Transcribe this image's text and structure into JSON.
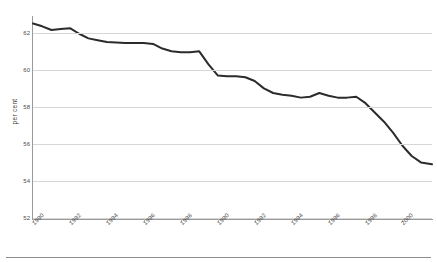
{
  "chart_data": {
    "type": "line",
    "title": "",
    "xlabel": "",
    "ylabel": "per cent",
    "ylim": [
      52,
      62.8
    ],
    "yticks": [
      52,
      54,
      56,
      58,
      60,
      62
    ],
    "xticklabels": [
      "1990",
      "1992",
      "1994",
      "1996",
      "1998",
      "1990",
      "1992",
      "1994",
      "1996",
      "1998",
      "2000",
      "2002",
      "2004",
      "2006",
      "2008",
      "2010"
    ],
    "xtick_years": [
      1990,
      1992,
      1994,
      1996,
      1998,
      2000,
      2002,
      2004,
      2006,
      2008,
      2010
    ],
    "xlim": [
      1990,
      2011.6
    ],
    "grid": "horizontal",
    "legend": "none",
    "series": [
      {
        "name": "participation rate",
        "color": "#2b2b2b",
        "x": [
          1990.0,
          1990.5,
          1991.0,
          1991.5,
          1992.0,
          1992.5,
          1993.0,
          1993.5,
          1994.0,
          1994.5,
          1995.0,
          1995.5,
          1996.0,
          1996.5,
          1997.0,
          1997.5,
          1998.0,
          1998.5,
          1999.0,
          1999.5,
          2000.0,
          2000.5,
          2001.0,
          2001.5,
          2002.0,
          2002.5,
          2003.0,
          2003.5,
          2004.0,
          2004.5,
          2005.0,
          2005.5,
          2006.0,
          2006.5,
          2007.0,
          2007.5,
          2008.0,
          2008.5,
          2009.0,
          2009.5,
          2010.0,
          2010.5,
          2011.0,
          2011.6
        ],
        "values": [
          62.5,
          62.35,
          62.15,
          62.2,
          62.25,
          61.95,
          61.7,
          61.6,
          61.5,
          61.48,
          61.45,
          61.45,
          61.45,
          61.4,
          61.15,
          61.0,
          60.95,
          60.95,
          61.0,
          60.3,
          59.7,
          59.65,
          59.65,
          59.6,
          59.4,
          59.0,
          58.75,
          58.65,
          58.6,
          58.5,
          58.55,
          58.75,
          58.6,
          58.5,
          58.5,
          58.55,
          58.2,
          57.7,
          57.2,
          56.6,
          55.9,
          55.35,
          55.0,
          54.9
        ]
      }
    ],
    "annotations": []
  },
  "axes": {
    "y_title": "per cent"
  }
}
